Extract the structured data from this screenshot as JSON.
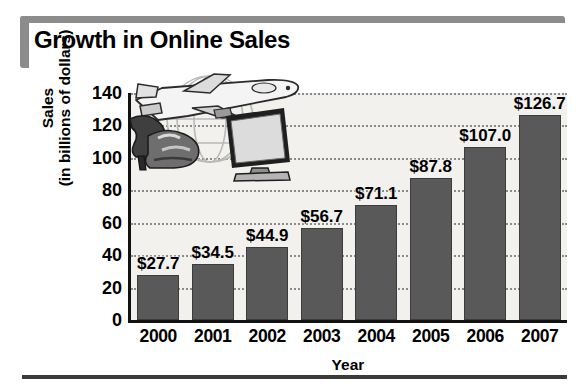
{
  "header": {
    "title": "Growth in Online Sales"
  },
  "chart_data": {
    "type": "bar",
    "title": "Growth in Online Sales",
    "xlabel": "Year",
    "ylabel": "Sales (in billions of dollars)",
    "ylabel_line1": "Sales",
    "ylabel_line2": "(in billions of dollars)",
    "categories": [
      "2000",
      "2001",
      "2002",
      "2003",
      "2004",
      "2005",
      "2006",
      "2007"
    ],
    "values": [
      27.7,
      34.5,
      44.9,
      56.7,
      71.1,
      87.8,
      107.0,
      126.7
    ],
    "data_labels": [
      "$27.7",
      "$34.5",
      "$44.9",
      "$56.7",
      "$71.1",
      "$87.8",
      "$107.0",
      "$126.7"
    ],
    "ylim": [
      0,
      140
    ],
    "yticks": [
      140,
      120,
      100,
      80,
      60,
      40,
      20,
      0
    ],
    "ytick_labels": [
      "140",
      "120",
      "100",
      "80",
      "60",
      "40",
      "20",
      "0"
    ],
    "grid": true,
    "grid_axis": "y",
    "grid_style": "dotted",
    "legend": null,
    "bar_color": "#595959",
    "plot_background": "#f2f1ee",
    "axis_color": "#111111"
  },
  "decor": {
    "accent_color": "#8c8c8c",
    "rule_color": "#3a3a3a",
    "clipart": [
      "airplane-icon",
      "globe-icon",
      "high-heel-shoes-icon",
      "computer-monitor-icon"
    ]
  }
}
